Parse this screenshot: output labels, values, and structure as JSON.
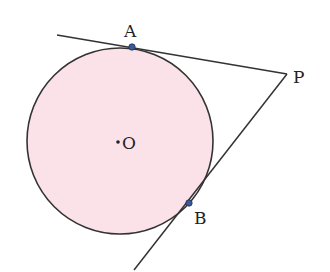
{
  "diagram": {
    "type": "geometry-tangent-lines",
    "circle": {
      "cx": 120,
      "cy": 141,
      "r": 93,
      "fill": "#fbe1e8",
      "stroke": "#333333"
    },
    "points": {
      "A": {
        "label": "A",
        "x": 132,
        "y": 47
      },
      "B": {
        "label": "B",
        "x": 189,
        "y": 203
      },
      "P": {
        "label": "P",
        "x": 287,
        "y": 74
      },
      "O": {
        "label": "O",
        "x": 118,
        "y": 142
      }
    },
    "lines": [
      {
        "name": "tangent-PA",
        "x1": 57,
        "y1": 35,
        "x2": 287,
        "y2": 74
      },
      {
        "name": "tangent-PB",
        "x1": 287,
        "y1": 74,
        "x2": 134,
        "y2": 270
      }
    ],
    "point_color": "#3a5a99"
  }
}
